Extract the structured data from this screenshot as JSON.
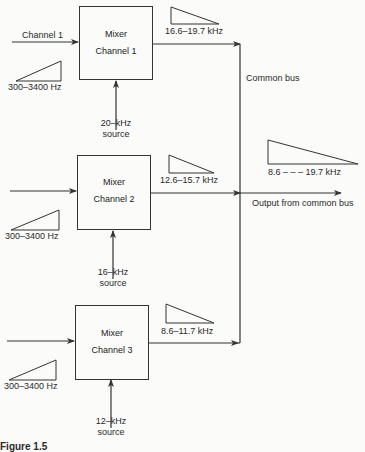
{
  "figure": {
    "mixers": [
      {
        "line1": "Mixer",
        "line2": "Channel 1",
        "source_line1": "20–kHz",
        "source_line2": "source",
        "input_label": "Channel 1",
        "input_band": "300–3400  Hz",
        "output_band": "16.6–19.7  kHz"
      },
      {
        "line1": "Mixer",
        "line2": "Channel  2",
        "source_line1": "16–kHz",
        "source_line2": "source",
        "input_label": "",
        "input_band": "300–3400  Hz",
        "output_band": "12.6–15.7  kHz"
      },
      {
        "line1": "Mixer",
        "line2": "Channel  3",
        "source_line1": "12–kHz",
        "source_line2": "source",
        "input_label": "",
        "input_band": "300–3400  Hz",
        "output_band": "8.6–11.7  kHz"
      }
    ],
    "bus_label": "Common bus",
    "output_label": "Output from common bus",
    "output_band": "8.6  – – –  19.7  kHz",
    "caption_partial": "Figure 1.5"
  }
}
